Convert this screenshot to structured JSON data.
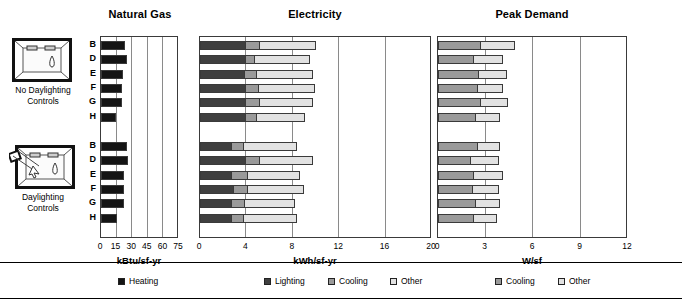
{
  "figure": {
    "width": 682,
    "height": 308,
    "background": "#ffffff"
  },
  "row_groups": [
    {
      "icon_name": "room-no-daylighting-icon",
      "caption_line1": "No Daylighting",
      "caption_line2": "Controls",
      "rows": [
        "B",
        "D",
        "E",
        "F",
        "G",
        "H"
      ]
    },
    {
      "icon_name": "room-daylighting-icon",
      "caption_line1": "Daylighting",
      "caption_line2": "Controls",
      "rows": [
        "B",
        "D",
        "E",
        "F",
        "G",
        "H"
      ]
    }
  ],
  "colors": {
    "heating": "#141414",
    "lighting": "#3f3f3f",
    "cooling": "#9a9a9a",
    "other": "#e2e2e2",
    "outline": "#3a3a3a",
    "grid": "#8a8a8a"
  },
  "legends": [
    {
      "name": "natural-gas-legend",
      "entries": [
        {
          "label": "Heating",
          "color": "#141414"
        }
      ]
    },
    {
      "name": "electricity-legend",
      "entries": [
        {
          "label": "Lighting",
          "color": "#3f3f3f"
        },
        {
          "label": "Cooling",
          "color": "#9a9a9a"
        },
        {
          "label": "Other",
          "color": "#e2e2e2"
        }
      ]
    },
    {
      "name": "peak-demand-legend",
      "entries": [
        {
          "label": "Cooling",
          "color": "#9a9a9a"
        },
        {
          "label": "Other",
          "color": "#e2e2e2"
        }
      ]
    }
  ],
  "chart_data": [
    {
      "type": "bar",
      "orientation": "horizontal",
      "stacked": true,
      "title": "Natural Gas",
      "xlabel": "kBtu/sf-yr",
      "ylabel": "",
      "xlim": [
        0,
        75
      ],
      "ticks": [
        0,
        15,
        30,
        45,
        60,
        75
      ],
      "grid": true,
      "legend_position": "bottom",
      "categories": [
        "No Daylighting Controls / B",
        "No Daylighting Controls / D",
        "No Daylighting Controls / E",
        "No Daylighting Controls / F",
        "No Daylighting Controls / G",
        "No Daylighting Controls / H",
        "Daylighting Controls / B",
        "Daylighting Controls / D",
        "Daylighting Controls / E",
        "Daylighting Controls / F",
        "Daylighting Controls / G",
        "Daylighting Controls / H"
      ],
      "series": [
        {
          "name": "Heating",
          "color": "#141414",
          "values": [
            23,
            25,
            21,
            20,
            20,
            14,
            25,
            26,
            22,
            22,
            22,
            15
          ]
        }
      ]
    },
    {
      "type": "bar",
      "orientation": "horizontal",
      "stacked": true,
      "title": "Electricity",
      "xlabel": "kWh/sf-yr",
      "ylabel": "",
      "xlim": [
        0,
        20
      ],
      "ticks": [
        0,
        4,
        8,
        12,
        16,
        20
      ],
      "grid": true,
      "legend_position": "bottom",
      "categories": [
        "No Daylighting Controls / B",
        "No Daylighting Controls / D",
        "No Daylighting Controls / E",
        "No Daylighting Controls / F",
        "No Daylighting Controls / G",
        "No Daylighting Controls / H",
        "Daylighting Controls / B",
        "Daylighting Controls / D",
        "Daylighting Controls / E",
        "Daylighting Controls / F",
        "Daylighting Controls / G",
        "Daylighting Controls / H"
      ],
      "series": [
        {
          "name": "Lighting",
          "color": "#3f3f3f",
          "values": [
            4.0,
            4.0,
            3.9,
            4.0,
            4.0,
            4.0,
            2.8,
            4.0,
            2.8,
            2.9,
            2.8,
            2.8
          ]
        },
        {
          "name": "Cooling",
          "color": "#9a9a9a",
          "values": [
            1.3,
            0.8,
            1.1,
            1.2,
            1.3,
            1.0,
            1.1,
            1.3,
            1.4,
            1.3,
            1.2,
            1.1
          ]
        },
        {
          "name": "Other",
          "color": "#e2e2e2",
          "values": [
            4.9,
            4.9,
            4.9,
            4.9,
            4.6,
            4.2,
            4.6,
            4.6,
            4.6,
            4.9,
            4.4,
            4.6
          ]
        }
      ]
    },
    {
      "type": "bar",
      "orientation": "horizontal",
      "stacked": true,
      "title": "Peak Demand",
      "xlabel": "W/sf",
      "ylabel": "",
      "xlim": [
        0,
        12
      ],
      "ticks": [
        0,
        3,
        6,
        9,
        12
      ],
      "grid": true,
      "legend_position": "bottom",
      "categories": [
        "No Daylighting Controls / B",
        "No Daylighting Controls / D",
        "No Daylighting Controls / E",
        "No Daylighting Controls / F",
        "No Daylighting Controls / G",
        "No Daylighting Controls / H",
        "Daylighting Controls / B",
        "Daylighting Controls / D",
        "Daylighting Controls / E",
        "Daylighting Controls / F",
        "Daylighting Controls / G",
        "Daylighting Controls / H"
      ],
      "series": [
        {
          "name": "Cooling",
          "color": "#9a9a9a",
          "values": [
            2.7,
            2.3,
            2.6,
            2.5,
            2.7,
            2.4,
            2.5,
            2.1,
            2.3,
            2.2,
            2.4,
            2.3
          ]
        },
        {
          "name": "Other",
          "color": "#e2e2e2",
          "values": [
            2.2,
            1.9,
            1.8,
            1.7,
            1.8,
            1.6,
            1.5,
            1.8,
            1.9,
            1.7,
            1.6,
            1.5
          ]
        }
      ]
    }
  ]
}
